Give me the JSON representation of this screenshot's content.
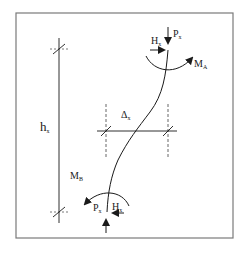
{
  "diagram": {
    "colors": {
      "frame": "#7a7a7a",
      "line": "#1a1a1a",
      "dashed": "#555555",
      "background": "#ffffff"
    },
    "labels": {
      "height": {
        "main": "h",
        "sub": "x"
      },
      "drift": {
        "main": "Δ",
        "sub": "x"
      },
      "top_axial": {
        "main": "P",
        "sub": "x"
      },
      "top_shear": {
        "main": "H",
        "sub": "x"
      },
      "top_moment": {
        "main": "M",
        "sub": "A"
      },
      "bottom_moment": {
        "main": "M",
        "sub": "B"
      },
      "bottom_axial": {
        "main": "P",
        "sub": "x"
      },
      "bottom_shear": {
        "main": "H",
        "sub": "x"
      }
    }
  }
}
